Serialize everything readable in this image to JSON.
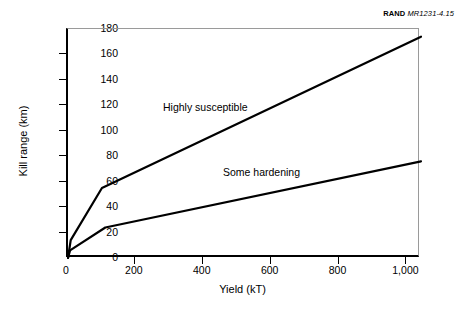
{
  "credit": {
    "brand": "RAND",
    "code": "MR1231-4.15"
  },
  "chart_data": {
    "type": "line",
    "title": "",
    "xlabel": "Yield (kT)",
    "ylabel": "Kill range (km)",
    "xlim": [
      0,
      1040
    ],
    "ylim": [
      0,
      180
    ],
    "xticks": [
      0,
      200,
      400,
      600,
      800,
      1000
    ],
    "xticklabels": [
      "0",
      "200",
      "400",
      "600",
      "800",
      "1,000"
    ],
    "yticks": [
      0,
      20,
      40,
      60,
      80,
      100,
      120,
      140,
      160,
      180
    ],
    "yticklabels": [
      "0",
      "20",
      "40",
      "60",
      "80",
      "100",
      "120",
      "140",
      "160",
      "180"
    ],
    "grid": false,
    "legend": "inline-annotations",
    "series": [
      {
        "name": "Highly susceptible",
        "color": "#000000",
        "points": [
          {
            "x": 0,
            "y": 0
          },
          {
            "x": 8,
            "y": 14
          },
          {
            "x": 100,
            "y": 55
          },
          {
            "x": 1040,
            "y": 174
          }
        ]
      },
      {
        "name": "Some hardening",
        "color": "#000000",
        "points": [
          {
            "x": 0,
            "y": 0
          },
          {
            "x": 6,
            "y": 6
          },
          {
            "x": 110,
            "y": 24
          },
          {
            "x": 1040,
            "y": 76
          }
        ]
      }
    ],
    "annotations": [
      {
        "text": "Highly susceptible",
        "x": 330,
        "y": 108
      },
      {
        "text": "Some hardening",
        "x": 520,
        "y": 62
      }
    ]
  }
}
